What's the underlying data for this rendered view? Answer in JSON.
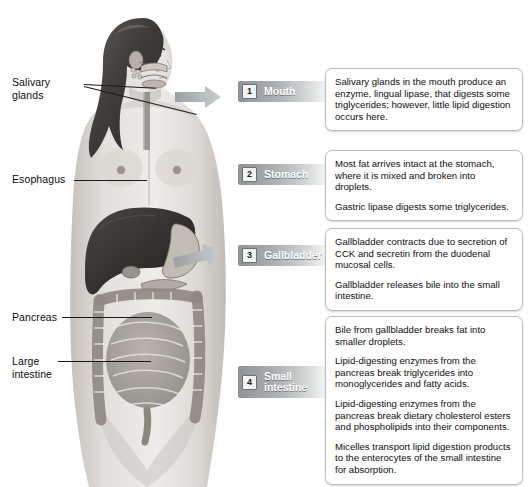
{
  "figure": {
    "organ_labels": [
      {
        "name": "salivary-glands",
        "text": "Salivary\nglands"
      },
      {
        "name": "esophagus",
        "text": "Esophagus"
      },
      {
        "name": "pancreas",
        "text": "Pancreas"
      },
      {
        "name": "large-intestine",
        "text": "Large\nintestine"
      }
    ]
  },
  "left_annotations": {
    "salivary_glands_line1": "Salivary",
    "salivary_glands_line2": "glands",
    "esophagus": "Esophagus",
    "pancreas": "Pancreas",
    "large_intestine_line1": "Large",
    "large_intestine_line2": "intestine"
  },
  "steps": [
    {
      "number": "1",
      "label": "Mouth",
      "label_line2": "",
      "has_arrow": true,
      "paragraphs": [
        "Salivary glands in the mouth produce an enzyme, lingual lipase, that digests some triglycerides; however, little lipid digestion occurs here."
      ]
    },
    {
      "number": "2",
      "label": "Stomach",
      "label_line2": "",
      "has_arrow": false,
      "paragraphs": [
        "Most fat arrives intact at the stomach, where it is mixed and broken into droplets.",
        "Gastric lipase digests some triglycerides."
      ]
    },
    {
      "number": "3",
      "label": "Gallbladder",
      "label_line2": "",
      "has_arrow": true,
      "paragraphs": [
        "Gallbladder contracts due to secretion of CCK and secretin from the duodenal mucosal cells.",
        "Gallbladder releases bile into the small intestine."
      ]
    },
    {
      "number": "4",
      "label": "Small",
      "label_line2": "intestine",
      "has_arrow": false,
      "paragraphs": [
        "Bile from gallbladder breaks fat into smaller droplets.",
        "Lipid-digesting enzymes from the pancreas break triglycerides into monoglycerides and fatty acids.",
        "Lipid-digesting enzymes from the pancreas break dietary cholesterol esters and phospholipids into their components.",
        "Micelles transport lipid digestion products to the enterocytes of the small intestine for absorption."
      ]
    }
  ],
  "colors": {
    "background": "#ffffff",
    "banner_dark": "#8f9396",
    "banner_light": "#f6f7f7",
    "callout_border": "#b9bdbf",
    "text": "#101010",
    "liver": "#3c3a38",
    "skin": "#d9d4cf"
  }
}
